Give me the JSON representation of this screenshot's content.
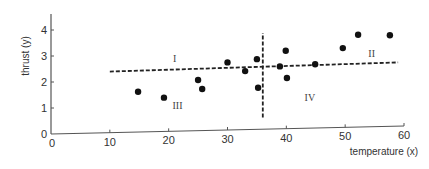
{
  "chart_data": {
    "type": "scatter",
    "title": "",
    "xlabel": "temperature (x)",
    "ylabel": "thrust (y)",
    "xlim": [
      0,
      60
    ],
    "ylim": [
      0,
      4
    ],
    "x_ticks": [
      0,
      10,
      20,
      30,
      40,
      50,
      60
    ],
    "y_ticks": [
      0,
      1,
      2,
      3,
      4
    ],
    "grid": false,
    "legend": null,
    "series": [
      {
        "name": "observations",
        "points": [
          {
            "x": 14.8,
            "y": 1.55
          },
          {
            "x": 19.2,
            "y": 1.3
          },
          {
            "x": 25.0,
            "y": 1.95
          },
          {
            "x": 25.7,
            "y": 1.6
          },
          {
            "x": 30.0,
            "y": 2.6
          },
          {
            "x": 33.0,
            "y": 2.25
          },
          {
            "x": 35.0,
            "y": 2.7
          },
          {
            "x": 35.2,
            "y": 1.6
          },
          {
            "x": 38.9,
            "y": 2.4
          },
          {
            "x": 39.9,
            "y": 3.0
          },
          {
            "x": 40.1,
            "y": 1.95
          },
          {
            "x": 44.9,
            "y": 2.45
          },
          {
            "x": 49.6,
            "y": 3.05
          },
          {
            "x": 52.2,
            "y": 3.55
          },
          {
            "x": 57.6,
            "y": 3.5
          }
        ]
      }
    ],
    "reference_lines": [
      {
        "orientation": "horizontal",
        "style": "dashed",
        "x_from": 10,
        "x_to": 59,
        "y_from": 2.35,
        "y_to": 2.45,
        "label": "mean thrust"
      },
      {
        "orientation": "vertical",
        "style": "dashed",
        "x": 36,
        "y_from": 0.45,
        "y_to": 3.7,
        "label": "mean temperature"
      }
    ],
    "annotations": [
      {
        "text": "I",
        "x": 21,
        "y": 2.65
      },
      {
        "text": "II",
        "x": 54.5,
        "y": 2.7
      },
      {
        "text": "III",
        "x": 21.5,
        "y": 0.85
      },
      {
        "text": "IV",
        "x": 44,
        "y": 1.05
      }
    ]
  },
  "labels": {
    "xlabel": "temperature (x)",
    "ylabel": "thrust (y)",
    "regions": [
      "I",
      "II",
      "III",
      "IV"
    ]
  }
}
